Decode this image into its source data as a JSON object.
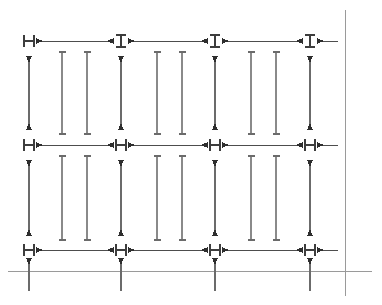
{
  "drawing": {
    "title": "Dimension Grid Drawing",
    "width": 382,
    "height": 305,
    "background_color": "#ffffff",
    "line_color": "#4d4d4d",
    "reference_line_color": "#9a9a9a",
    "marker_color": "#2e2e2e",
    "description": "Engineering dimension layout with three horizontal dimension-chain rows, four vertical dimension-chain columns, interior tick extension lines, and two datum reference lines."
  },
  "geometry": {
    "column_x": [
      29,
      121,
      215,
      310
    ],
    "interior_tick_x": [
      62,
      87,
      157,
      182,
      251,
      276
    ],
    "row_y": [
      41,
      145,
      250
    ],
    "datum_vertical_x": 345,
    "datum_vertical_y1": 10,
    "datum_vertical_y2": 296,
    "datum_horizontal_y": 271,
    "datum_horizontal_x1": 8,
    "datum_horizontal_x2": 372,
    "vertical_span_top": 56,
    "vertical_span_bottom": 236,
    "interior_tick_top": 52,
    "interior_tick_bottom": 240,
    "column_stub_bottom": 291
  },
  "rows": [
    {
      "id": "row-top",
      "y": 41,
      "marker_shape": [
        "H",
        "I",
        "I",
        "I"
      ],
      "segments": [
        {
          "from_x": 29,
          "to_x": 121,
          "label": ""
        },
        {
          "from_x": 121,
          "to_x": 215,
          "label": ""
        },
        {
          "from_x": 215,
          "to_x": 310,
          "label": ""
        },
        {
          "from_x": 310,
          "to_x": 345,
          "label": ""
        }
      ]
    },
    {
      "id": "row-middle",
      "y": 145,
      "marker_shape": [
        "H",
        "H",
        "H",
        "H"
      ],
      "segments": [
        {
          "from_x": 29,
          "to_x": 121,
          "label": ""
        },
        {
          "from_x": 121,
          "to_x": 215,
          "label": ""
        },
        {
          "from_x": 215,
          "to_x": 310,
          "label": ""
        },
        {
          "from_x": 310,
          "to_x": 345,
          "label": ""
        }
      ]
    },
    {
      "id": "row-bottom",
      "y": 250,
      "marker_shape": [
        "H",
        "H",
        "H",
        "H"
      ],
      "segments": [
        {
          "from_x": 29,
          "to_x": 121,
          "label": ""
        },
        {
          "from_x": 121,
          "to_x": 215,
          "label": ""
        },
        {
          "from_x": 215,
          "to_x": 310,
          "label": ""
        },
        {
          "from_x": 310,
          "to_x": 345,
          "label": ""
        }
      ]
    }
  ],
  "columns": [
    {
      "id": "column-1",
      "x": 29,
      "segments": [
        {
          "from_y": 56,
          "to_y": 130
        },
        {
          "from_y": 160,
          "to_y": 236
        }
      ]
    },
    {
      "id": "column-2",
      "x": 121,
      "segments": [
        {
          "from_y": 56,
          "to_y": 130
        },
        {
          "from_y": 160,
          "to_y": 236
        }
      ]
    },
    {
      "id": "column-3",
      "x": 215,
      "segments": [
        {
          "from_y": 56,
          "to_y": 130
        },
        {
          "from_y": 160,
          "to_y": 236
        }
      ]
    },
    {
      "id": "column-4",
      "x": 310,
      "segments": [
        {
          "from_y": 56,
          "to_y": 130
        },
        {
          "from_y": 160,
          "to_y": 236
        }
      ]
    }
  ],
  "interior_ticks": [
    {
      "id": "tick-1",
      "x": 62,
      "segments": [
        {
          "from_y": 52,
          "to_y": 134
        },
        {
          "from_y": 156,
          "to_y": 240
        }
      ]
    },
    {
      "id": "tick-2",
      "x": 87,
      "segments": [
        {
          "from_y": 52,
          "to_y": 134
        },
        {
          "from_y": 156,
          "to_y": 240
        }
      ]
    },
    {
      "id": "tick-3",
      "x": 157,
      "segments": [
        {
          "from_y": 52,
          "to_y": 134
        },
        {
          "from_y": 156,
          "to_y": 240
        }
      ]
    },
    {
      "id": "tick-4",
      "x": 182,
      "segments": [
        {
          "from_y": 52,
          "to_y": 134
        },
        {
          "from_y": 156,
          "to_y": 240
        }
      ]
    },
    {
      "id": "tick-5",
      "x": 251,
      "segments": [
        {
          "from_y": 52,
          "to_y": 134
        },
        {
          "from_y": 156,
          "to_y": 240
        }
      ]
    },
    {
      "id": "tick-6",
      "x": 276,
      "segments": [
        {
          "from_y": 52,
          "to_y": 134
        },
        {
          "from_y": 156,
          "to_y": 240
        }
      ]
    }
  ],
  "bottom_stubs": [
    {
      "id": "stub-1",
      "x": 29,
      "from_y": 258,
      "to_y": 291
    },
    {
      "id": "stub-2",
      "x": 121,
      "from_y": 258,
      "to_y": 291
    },
    {
      "id": "stub-3",
      "x": 215,
      "from_y": 258,
      "to_y": 291
    },
    {
      "id": "stub-4",
      "x": 310,
      "from_y": 258,
      "to_y": 291
    }
  ],
  "datum_lines": [
    {
      "id": "datum-vertical",
      "orientation": "vertical",
      "position": 345
    },
    {
      "id": "datum-horizontal",
      "orientation": "horizontal",
      "position": 271
    }
  ]
}
